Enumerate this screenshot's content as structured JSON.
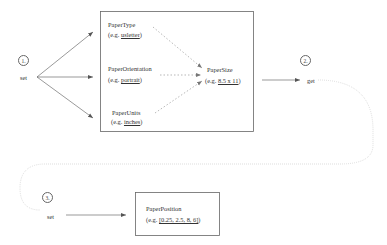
{
  "steps": [
    {
      "number": "1.",
      "action": "set"
    },
    {
      "number": "2.",
      "action": "get"
    },
    {
      "number": "3.",
      "action": "set"
    }
  ],
  "inputs": [
    {
      "name": "PaperType",
      "example_prefix": "(e.g. ",
      "example_value": "usletter",
      "example_suffix": ")"
    },
    {
      "name": "PaperOrientation",
      "example_prefix": "(e.g. ",
      "example_value": "portrait",
      "example_suffix": ")"
    },
    {
      "name": "PaperUnits",
      "example_prefix": "(e.g. ",
      "example_value": "inches",
      "example_suffix": ")"
    }
  ],
  "derived": {
    "name": "PaperSize",
    "example_prefix": "(e.g. ",
    "example_value": "8.5 x 11",
    "example_suffix": ")"
  },
  "final": {
    "name": "PaperPosition",
    "example_prefix": "(e.g. ",
    "example_value": "[0.25, 2.5, 8, 6]",
    "example_suffix": ")"
  },
  "colors": {
    "line": "#555555",
    "dotted": "#999999",
    "curve": "#cccccc"
  }
}
